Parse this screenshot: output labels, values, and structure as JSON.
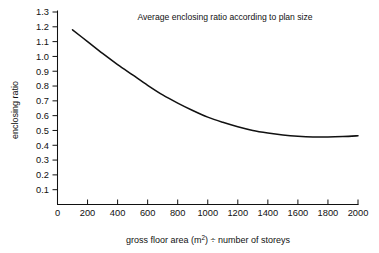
{
  "chart_data": {
    "type": "line",
    "title": "Average enclosing ratio according to plan size",
    "xlabel_parts": {
      "before": "gross floor area (m",
      "sup": "2",
      "after": ") ÷ number of storeys"
    },
    "xlabel": "gross floor area (m2) ÷ number of storeys",
    "ylabel": "enclosing ratio",
    "xlim": [
      0,
      2000
    ],
    "ylim": [
      0,
      1.3
    ],
    "grid": false,
    "legend": null,
    "xticks": [
      0,
      200,
      400,
      600,
      800,
      1000,
      1200,
      1400,
      1600,
      1800,
      2000
    ],
    "xtick_labels": [
      "0",
      "200",
      "400",
      "600",
      "800",
      "1000",
      "1200",
      "1400",
      "1600",
      "1800",
      "2000"
    ],
    "yticks": [
      0.1,
      0.2,
      0.3,
      0.4,
      0.5,
      0.6,
      0.7,
      0.8,
      0.9,
      1.0,
      1.1,
      1.2,
      1.3
    ],
    "ytick_labels": [
      "0.1",
      "0.2",
      "0.3",
      "0.4",
      "0.5",
      "0.6",
      "0.7",
      "0.8",
      "0.9",
      "1.0",
      "1.1",
      "1.2",
      "1.3"
    ],
    "series": [
      {
        "name": "average enclosing ratio",
        "color": "#111111",
        "x": [
          100,
          200,
          300,
          400,
          500,
          600,
          700,
          800,
          900,
          1000,
          1100,
          1200,
          1300,
          1400,
          1500,
          1600,
          1700,
          1800,
          1900,
          2000
        ],
        "y": [
          1.18,
          1.1,
          1.02,
          0.945,
          0.875,
          0.805,
          0.74,
          0.685,
          0.635,
          0.59,
          0.555,
          0.525,
          0.5,
          0.483,
          0.47,
          0.461,
          0.456,
          0.456,
          0.459,
          0.464
        ]
      }
    ]
  }
}
